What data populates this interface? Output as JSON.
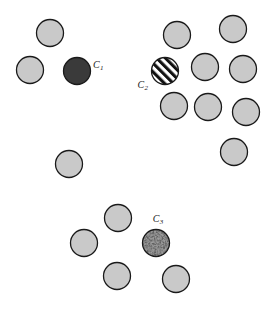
{
  "figure": {
    "width": 271,
    "height": 316,
    "background_color": "#ffffff"
  },
  "style": {
    "disc_fill": "#c9c9c9",
    "disc_stroke": "#1a1a1a",
    "disc_stroke_width": 1.3,
    "disc_radius": 13.5,
    "solid_fill": "#3a3a3a",
    "stripe_dark": "#111111",
    "stripe_light": "#ffffff",
    "speckle_base": "#9a9a9a",
    "speckle_dark": "#2b2b2b",
    "label_color": "#1a1a1a"
  },
  "chart_data": {
    "type": "scatter",
    "title": "",
    "xlabel": "",
    "ylabel": "",
    "xlim": [
      0,
      271
    ],
    "ylim": [
      0,
      316
    ],
    "grid": false,
    "legend": "none",
    "marker": "circle",
    "marker_radius": 13.5,
    "groups": [
      {
        "name": "upper-left-cluster",
        "points": [
          {
            "x": 50,
            "y": 33,
            "fill": "plain"
          },
          {
            "x": 30,
            "y": 70,
            "fill": "plain"
          }
        ]
      },
      {
        "name": "upper-right-cluster",
        "points": [
          {
            "x": 177,
            "y": 35,
            "fill": "plain"
          },
          {
            "x": 233,
            "y": 29,
            "fill": "plain"
          },
          {
            "x": 205,
            "y": 67,
            "fill": "plain"
          },
          {
            "x": 243,
            "y": 69,
            "fill": "plain"
          },
          {
            "x": 174,
            "y": 106,
            "fill": "plain"
          },
          {
            "x": 208,
            "y": 107,
            "fill": "plain"
          },
          {
            "x": 246,
            "y": 112,
            "fill": "plain"
          },
          {
            "x": 234,
            "y": 152,
            "fill": "plain"
          }
        ]
      },
      {
        "name": "isolated-middle-left",
        "points": [
          {
            "x": 69,
            "y": 164,
            "fill": "plain"
          }
        ]
      },
      {
        "name": "lower-cluster",
        "points": [
          {
            "x": 118,
            "y": 218,
            "fill": "plain"
          },
          {
            "x": 84,
            "y": 243,
            "fill": "plain"
          },
          {
            "x": 117,
            "y": 276,
            "fill": "plain"
          },
          {
            "x": 176,
            "y": 279,
            "fill": "plain"
          }
        ]
      }
    ],
    "highlighted": [
      {
        "id": "C1",
        "label": "C",
        "subscript": "1",
        "x": 77,
        "y": 71,
        "fill": "solid-dark",
        "label_x": 93,
        "label_y": 68,
        "label_anchor": "start"
      },
      {
        "id": "C2",
        "label": "C",
        "subscript": "2",
        "x": 165,
        "y": 71,
        "fill": "diagonal-stripes",
        "label_x": 148,
        "label_y": 88,
        "label_anchor": "end"
      },
      {
        "id": "C3",
        "label": "C",
        "subscript": "3",
        "x": 156,
        "y": 243,
        "fill": "speckled",
        "label_x": 158,
        "label_y": 222,
        "label_anchor": "middle"
      }
    ]
  }
}
